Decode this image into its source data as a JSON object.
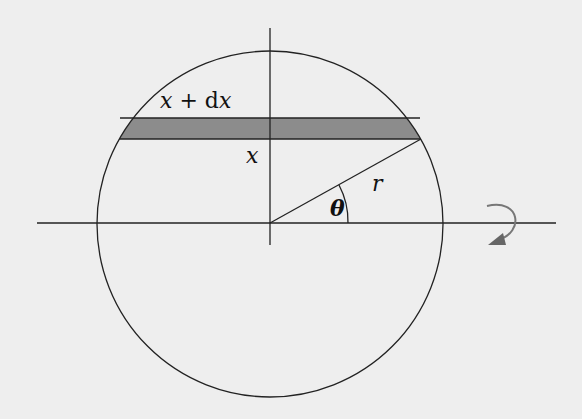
{
  "figure": {
    "labels": {
      "top_strip": "x + dx",
      "top_strip_parts": {
        "x": "x",
        "plus": " + ",
        "d": "d",
        "x2": "x"
      },
      "bottom_strip": "x",
      "radius": "r",
      "angle": "θ"
    },
    "colors": {
      "background": "#eeeeee",
      "stroke": "#222222",
      "strip_fill": "#8c8c8c",
      "rotation_arrow": "#777777"
    },
    "elements": [
      "circle",
      "horizontal-axis",
      "vertical-axis",
      "shaded-strip",
      "radius-line",
      "angle-arc",
      "rotation-arrow"
    ]
  }
}
